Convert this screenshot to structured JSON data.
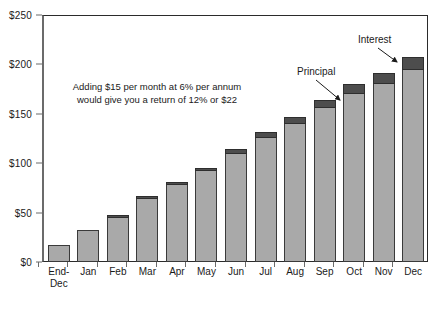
{
  "chart_data": {
    "type": "bar",
    "stacked": true,
    "title": "",
    "subtitle": "",
    "xlabel": "",
    "ylabel": "",
    "ylim": [
      0,
      250
    ],
    "ytick_labels": [
      "$0",
      "$50",
      "$100",
      "$150",
      "$200",
      "$250"
    ],
    "ytick_values": [
      0,
      50,
      100,
      150,
      200,
      250
    ],
    "grid": false,
    "legend_position": "none",
    "categories": [
      "End-Dec",
      "Jan",
      "Feb",
      "Mar",
      "Apr",
      "May",
      "Jun",
      "Jul",
      "Aug",
      "Sep",
      "Oct",
      "Nov",
      "Dec"
    ],
    "category_lines": [
      [
        "End-",
        "Dec"
      ],
      [
        "Jan"
      ],
      [
        "Feb"
      ],
      [
        "Mar"
      ],
      [
        "Apr"
      ],
      [
        "May"
      ],
      [
        "Jun"
      ],
      [
        "Jul"
      ],
      [
        "Aug"
      ],
      [
        "Sep"
      ],
      [
        "Oct"
      ],
      [
        "Nov"
      ],
      [
        "Dec"
      ]
    ],
    "series": [
      {
        "name": "Principal",
        "color": "#a9a9a9",
        "values": [
          17,
          32,
          47,
          65,
          78,
          92,
          109,
          126,
          140,
          156,
          170,
          180,
          194
        ]
      },
      {
        "name": "Interest",
        "color": "#4d4d4d",
        "values": [
          0,
          0,
          1,
          2,
          3,
          3,
          5,
          6,
          7,
          8,
          10,
          11,
          13
        ]
      }
    ],
    "totals": [
      17,
      32,
      48,
      67,
      81,
      95,
      114,
      132,
      147,
      164,
      180,
      191,
      207
    ],
    "annotations": [
      {
        "name": "note",
        "lines": [
          "Adding $15 per month at 6% per annum",
          "would give you a return of 12% or $22"
        ]
      },
      {
        "name": "principal-callout",
        "label": "Principal",
        "points_to": "Oct principal segment"
      },
      {
        "name": "interest-callout",
        "label": "Interest",
        "points_to": "Dec interest segment"
      }
    ]
  },
  "colors": {
    "principal": "#a9a9a9",
    "interest": "#4d4d4d",
    "axis": "#6b6b6b",
    "frame": "#2b2b2b",
    "text": "#1a1a1a",
    "background": "#ffffff"
  },
  "annotation": {
    "line1": "Adding $15 per month at 6% per annum",
    "line2": "would give you a return of 12% or $22"
  },
  "callouts": {
    "principal": "Principal",
    "interest": "Interest"
  },
  "y_axis": {
    "ticks": [
      "$0",
      "$50",
      "$100",
      "$150",
      "$200",
      "$250"
    ]
  },
  "x_axis": {
    "labels_line1": [
      "End-",
      "Jan",
      "Feb",
      "Mar",
      "Apr",
      "May",
      "Jun",
      "Jul",
      "Aug",
      "Sep",
      "Oct",
      "Nov",
      "Dec"
    ],
    "labels_line2": [
      "Dec",
      "",
      "",
      "",
      "",
      "",
      "",
      "",
      "",
      "",
      "",
      "",
      ""
    ]
  }
}
